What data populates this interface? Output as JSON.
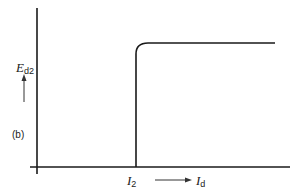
{
  "diagram": {
    "panel_label": "(b)",
    "y_axis": {
      "symbol": "E",
      "subscript": "d2",
      "arrow_direction": "up"
    },
    "x_axis": {
      "symbol": "I",
      "subscript": "d",
      "arrow_direction": "right"
    },
    "threshold": {
      "symbol": "I",
      "subscript": "2"
    },
    "curve": {
      "description": "step response: zero until I_2, then rises vertically and levels off with a rounded corner to a constant E_d2"
    },
    "colors": {
      "stroke": "#1a1a1a",
      "background": "#ffffff"
    }
  }
}
